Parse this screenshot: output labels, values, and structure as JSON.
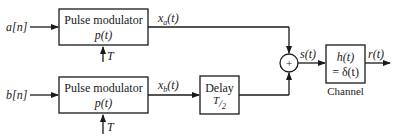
{
  "diagram": {
    "inputs": {
      "a": "a[n]",
      "b": "b[n]"
    },
    "blocks": {
      "modulator_top": {
        "title": "Pulse modulator",
        "func": "p(t)",
        "param": "T"
      },
      "modulator_bottom": {
        "title": "Pulse modulator",
        "func": "p(t)",
        "param": "T"
      },
      "delay": {
        "title": "Delay",
        "value": "T/2"
      },
      "channel": {
        "line1": "h(t)",
        "line2": "= δ(t)",
        "caption": "Channel"
      },
      "summer": {
        "symbol": "+"
      }
    },
    "signals": {
      "xa": "x_a(t)",
      "xb": "x_b(t)",
      "s": "s(t)",
      "r": "r(t)"
    }
  }
}
